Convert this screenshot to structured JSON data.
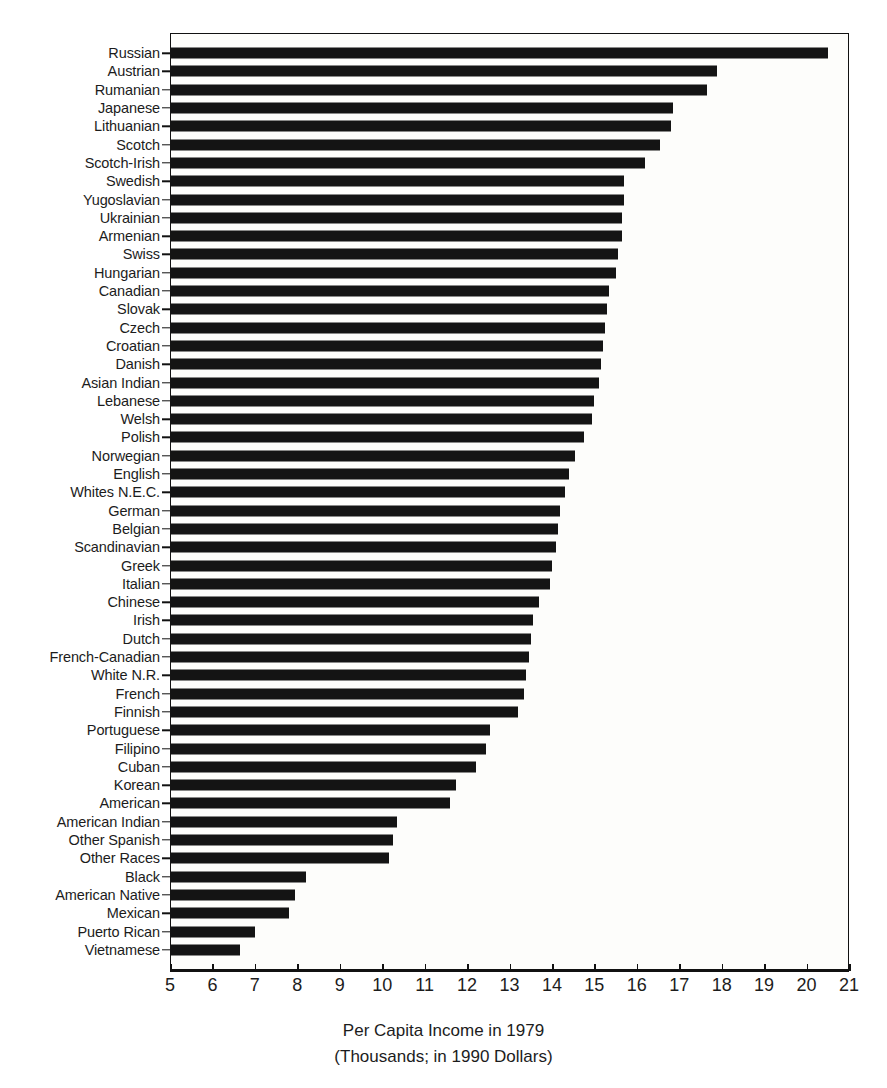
{
  "chart_data": {
    "type": "bar",
    "orientation": "horizontal",
    "title": "",
    "xlabel": "Per Capita Income in 1979",
    "xlabel_sub": "(Thousands; in 1990 Dollars)",
    "ylabel": "",
    "xlim": [
      5,
      21
    ],
    "xticks": [
      5,
      6,
      7,
      8,
      9,
      10,
      11,
      12,
      13,
      14,
      15,
      16,
      17,
      18,
      19,
      20,
      21
    ],
    "xticklabels": [
      "5",
      "6",
      "7",
      "8",
      "9",
      "10",
      "11",
      "12",
      "13",
      "14",
      "15",
      "16",
      "17",
      "18",
      "19",
      "20",
      "21"
    ],
    "grid": false,
    "legend": false,
    "bar_color": "#141414",
    "categories": [
      "Russian",
      "Austrian",
      "Rumanian",
      "Japanese",
      "Lithuanian",
      "Scotch",
      "Scotch-Irish",
      "Swedish",
      "Yugoslavian",
      "Ukrainian",
      "Armenian",
      "Swiss",
      "Hungarian",
      "Canadian",
      "Slovak",
      "Czech",
      "Croatian",
      "Danish",
      "Asian Indian",
      "Lebanese",
      "Welsh",
      "Polish",
      "Norwegian",
      "English",
      "Whites N.E.C.",
      "German",
      "Belgian",
      "Scandinavian",
      "Greek",
      "Italian",
      "Chinese",
      "Irish",
      "Dutch",
      "French-Canadian",
      "White N.R.",
      "French",
      "Finnish",
      "Portuguese",
      "Filipino",
      "Cuban",
      "Korean",
      "American",
      "American Indian",
      "Other Spanish",
      "Other Races",
      "Black",
      "American Native",
      "Mexican",
      "Puerto Rican",
      "Vietnamese"
    ],
    "values": [
      20.5,
      17.9,
      17.65,
      16.85,
      16.8,
      16.55,
      16.2,
      15.7,
      15.7,
      15.65,
      15.65,
      15.55,
      15.5,
      15.35,
      15.3,
      15.25,
      15.2,
      15.15,
      15.1,
      15.0,
      14.95,
      14.75,
      14.55,
      14.4,
      14.3,
      14.2,
      14.15,
      14.1,
      14.0,
      13.95,
      13.7,
      13.55,
      13.5,
      13.45,
      13.4,
      13.35,
      13.2,
      12.55,
      12.45,
      12.2,
      11.75,
      11.6,
      10.35,
      10.25,
      10.15,
      8.2,
      7.95,
      7.8,
      7.0,
      6.65
    ],
    "value_unit": "thousands of 1990 dollars"
  }
}
